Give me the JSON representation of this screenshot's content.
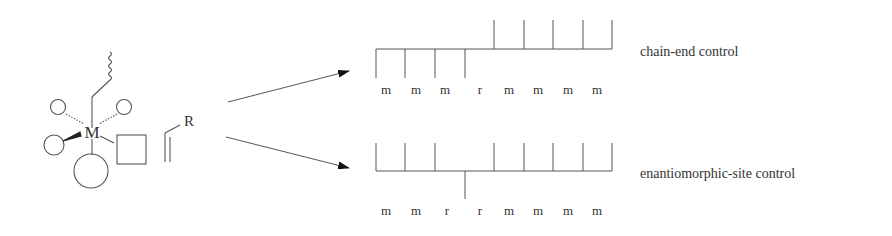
{
  "catalyst": {
    "metal_label": "M",
    "monomer_substituent": "R"
  },
  "chain_end_control": {
    "label": "chain-end control",
    "dyads": [
      "m",
      "m",
      "m",
      "r",
      "m",
      "m",
      "m",
      "m"
    ]
  },
  "enantiomorphic_site_control": {
    "label": "enantiomorphic-site control",
    "dyads": [
      "m",
      "m",
      "r",
      "r",
      "m",
      "m",
      "m",
      "m"
    ]
  },
  "colors": {
    "line": "#555555",
    "text": "#333333"
  }
}
